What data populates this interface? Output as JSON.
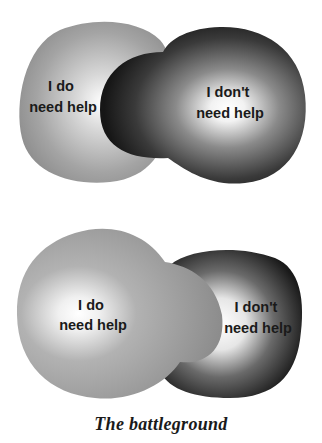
{
  "diagrams": [
    {
      "name": "top",
      "left_label": [
        "I do",
        "need help"
      ],
      "right_label": [
        "I don't",
        "need help"
      ],
      "dominant": "right"
    },
    {
      "name": "bottom",
      "left_label": [
        "I do",
        "need help"
      ],
      "right_label": [
        "I don't",
        "need help"
      ],
      "dominant": "left"
    }
  ],
  "caption": "The battleground",
  "colors": {
    "light_blob": "#8f8f8f",
    "dark_blob": "#1e1e1e",
    "highlight": "#ffffff",
    "text": "#1a1a1a"
  }
}
